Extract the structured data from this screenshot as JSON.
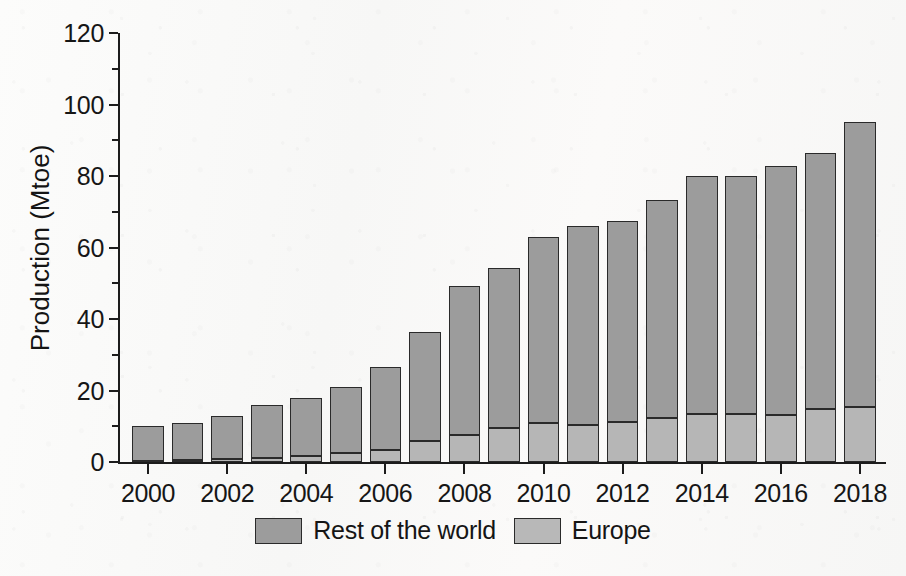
{
  "chart_data": {
    "type": "bar",
    "stacked": true,
    "title": "",
    "xlabel": "",
    "ylabel": "Production (Mtoe)",
    "ylim": [
      0,
      120
    ],
    "ytick_major_step": 20,
    "ytick_minor_step": 10,
    "ytick_labels": [
      "0",
      "20",
      "40",
      "60",
      "80",
      "100",
      "120"
    ],
    "ytick_values": [
      0,
      20,
      40,
      60,
      80,
      100,
      120
    ],
    "grid": false,
    "legend_position": "bottom-center",
    "categories": [
      2000,
      2001,
      2002,
      2003,
      2004,
      2005,
      2006,
      2007,
      2008,
      2009,
      2010,
      2011,
      2012,
      2013,
      2014,
      2015,
      2016,
      2017,
      2018
    ],
    "xtick_labels": [
      "2000",
      "2002",
      "2004",
      "2006",
      "2008",
      "2010",
      "2012",
      "2014",
      "2016",
      "2018"
    ],
    "xtick_values": [
      2000,
      2002,
      2004,
      2006,
      2008,
      2010,
      2012,
      2014,
      2016,
      2018
    ],
    "series": [
      {
        "name": "Europe",
        "color": "#b6b6b6",
        "values": [
          0.4,
          0.6,
          0.8,
          1.1,
          1.6,
          2.5,
          3.4,
          5.9,
          7.6,
          9.4,
          10.8,
          10.4,
          11.2,
          12.2,
          13.5,
          13.5,
          13.2,
          14.9,
          15.4
        ]
      },
      {
        "name": "Rest of the world",
        "color": "#9c9c9c",
        "values": [
          9.6,
          10.2,
          12.1,
          14.8,
          16.2,
          18.4,
          23.2,
          30.4,
          41.5,
          45.0,
          52.2,
          55.6,
          56.2,
          61.1,
          66.4,
          66.5,
          69.6,
          71.5,
          79.6
        ]
      }
    ],
    "totals": [
      10.0,
      10.8,
      12.9,
      15.9,
      17.8,
      20.9,
      26.6,
      36.3,
      49.1,
      54.4,
      63.0,
      66.0,
      67.4,
      73.3,
      79.9,
      80.0,
      82.8,
      86.4,
      95.0
    ]
  },
  "legend": {
    "items": [
      {
        "label": "Rest of the world",
        "swatch": "row"
      },
      {
        "label": "Europe",
        "swatch": "eu"
      }
    ]
  },
  "colors": {
    "rest_of_world": "#9c9c9c",
    "europe": "#b6b6b6",
    "axis": "#1c1c1c",
    "background": "#fbfbfa"
  }
}
